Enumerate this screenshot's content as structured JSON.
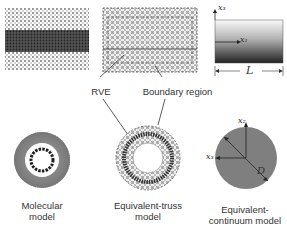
{
  "panels": {
    "molecular": {
      "label_line1": "Molecular",
      "label_line2": "model"
    },
    "truss": {
      "label_line1": "Equivalent-truss",
      "label_line2": "model",
      "callout_rve": "RVE",
      "callout_boundary": "Boundary region"
    },
    "continuum": {
      "label_line1": "Equivalent-",
      "label_line2": "continuum model",
      "axis_x1": "x₁",
      "axis_x2": "x₂",
      "axis_x3": "x₃",
      "length_label": "L",
      "diameter_label": "D"
    }
  },
  "colors": {
    "molecule_gray": "#6e6e6e",
    "dark_core": "#2a2a2a",
    "continuum_fill": "#7f7f7f"
  }
}
